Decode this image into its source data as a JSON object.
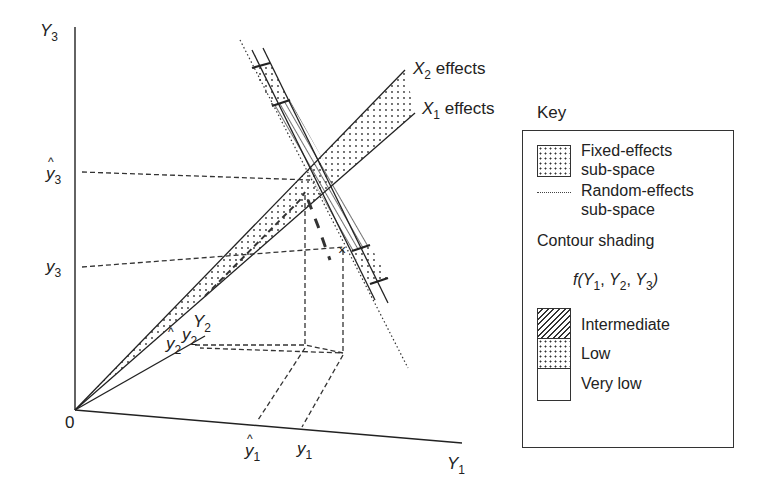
{
  "diagram": {
    "axes": {
      "y3": {
        "label": "Y",
        "sub": "3"
      },
      "y1": {
        "label": "Y",
        "sub": "1"
      },
      "origin": "0"
    },
    "axis_marks": {
      "y3_hat": {
        "label": "y",
        "sub": "3",
        "hat": true
      },
      "y3_obs": {
        "label": "y",
        "sub": "3"
      },
      "y1_hat": {
        "label": "y",
        "sub": "1",
        "hat": true
      },
      "y1_obs": {
        "label": "y",
        "sub": "1"
      },
      "y2_hat": {
        "label": "y",
        "sub": "2",
        "hat": true
      },
      "y2_obs": {
        "label": "y",
        "sub": "2"
      },
      "Y2": {
        "label": "Y",
        "sub": "2"
      }
    },
    "lines": {
      "x2_effects": {
        "var": "X",
        "sub": "2",
        "text": " effects"
      },
      "x1_effects": {
        "var": "X",
        "sub": "1",
        "text": " effects"
      }
    }
  },
  "key": {
    "title": "Key",
    "fixed_effects": {
      "line1": "Fixed-effects",
      "line2": "sub-space"
    },
    "random_effects": {
      "line1": "Random-effects",
      "line2": "sub-space"
    },
    "contour_title": "Contour shading",
    "function": {
      "f": "f(",
      "y1": "Y",
      "s1": "1",
      "c1": ", ",
      "y2": "Y",
      "s2": "2",
      "c2": ", ",
      "y3": "Y",
      "s3": "3",
      "close": ")"
    },
    "levels": [
      {
        "label": "Intermediate",
        "pattern": "hatch"
      },
      {
        "label": "Low",
        "pattern": "dots"
      },
      {
        "label": "Very low",
        "pattern": "none"
      }
    ]
  },
  "colors": {
    "ink": "#222222",
    "background": "#ffffff"
  }
}
